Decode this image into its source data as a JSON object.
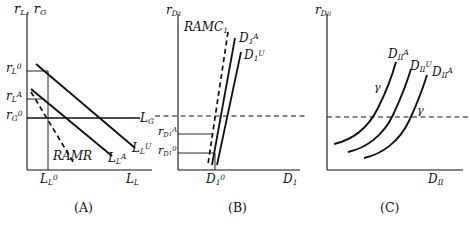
{
  "figure": {
    "title": "",
    "ink_color": "#111111",
    "panels": [
      {
        "tag": "(A)",
        "y_axis_label": "r",
        "y_axis_label_sub": "L",
        "y_axis_label_2": "r",
        "y_axis_label_2_sub": "G",
        "x_axis_label": "L",
        "x_axis_label_sub": "L",
        "y_ticks": [
          {
            "base": "r",
            "sub": "L",
            "sup": "0"
          },
          {
            "base": "r",
            "sub": "L",
            "sup": "A"
          },
          {
            "base": "r",
            "sub": "G",
            "sup": "0"
          }
        ],
        "x_ticks": [
          {
            "base": "L",
            "sub": "L",
            "sup": "0"
          }
        ],
        "curves": [
          {
            "name": "RAMR",
            "base": "RAMR",
            "sub": "",
            "sup": "",
            "style": "dashed"
          },
          {
            "name": "L_L^A",
            "base": "L",
            "sub": "L",
            "sup": "A",
            "style": "solid"
          },
          {
            "name": "L_L^U",
            "base": "L",
            "sub": "L",
            "sup": "U",
            "style": "solid"
          },
          {
            "name": "L_G",
            "base": "L",
            "sub": "G",
            "sup": "",
            "style": "solid"
          }
        ]
      },
      {
        "tag": "(B)",
        "y_axis_label": "r",
        "y_axis_label_sub": "D",
        "y_axis_label_sub2": "1",
        "x_axis_label": "D",
        "x_axis_label_sub": "1",
        "y_ticks": [
          {
            "base": "r",
            "sub": "D",
            "sub2": "1",
            "sup": "A"
          },
          {
            "base": "r",
            "sub": "D",
            "sub2": "1",
            "sup": "0"
          }
        ],
        "x_ticks": [
          {
            "base": "D",
            "sub": "1",
            "sup": "0"
          }
        ],
        "curves": [
          {
            "name": "RAMC_1",
            "base": "RAMC",
            "sub": "1",
            "sup": "",
            "style": "dashed"
          },
          {
            "name": "D_1^A",
            "base": "D",
            "sub": "1",
            "sup": "A",
            "style": "solid"
          },
          {
            "name": "D_1^U",
            "base": "D",
            "sub": "1",
            "sup": "U",
            "style": "solid"
          }
        ],
        "reference_line": "dashed-horizontal"
      },
      {
        "tag": "(C)",
        "y_axis_label": "r",
        "y_axis_label_sub": "D",
        "y_axis_label_sub2": "II",
        "x_axis_label": "D",
        "x_axis_label_sub": "II",
        "y_ticks": [],
        "x_ticks": [],
        "curves": [
          {
            "name": "D_II^A_left",
            "base": "D",
            "sub": "II",
            "sup": "A",
            "style": "solid"
          },
          {
            "name": "D_II^U",
            "base": "D",
            "sub": "II",
            "sup": "U",
            "style": "solid"
          },
          {
            "name": "D_II^A_right",
            "base": "D",
            "sub": "II",
            "sup": "A",
            "style": "solid"
          }
        ],
        "annotations": [
          {
            "symbol": "γ"
          },
          {
            "symbol": "γ"
          }
        ],
        "reference_line": "dashed-horizontal"
      }
    ]
  }
}
